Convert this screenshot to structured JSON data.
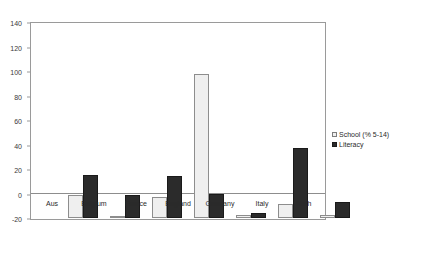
{
  "chart_data": {
    "type": "bar",
    "title": "",
    "xlabel": "",
    "ylabel": "",
    "ylim": [
      -20,
      140
    ],
    "yticks": [
      140,
      120,
      100,
      80,
      60,
      40,
      20,
      0,
      -20
    ],
    "grid": false,
    "legend_position": "right",
    "categories": [
      "Aus",
      "Belgium",
      "France",
      "England",
      "Germany",
      "Italy",
      "Neth"
    ],
    "series": [
      {
        "name": "School (% 5-14)",
        "color": "#efefef",
        "values": [
          18,
          1,
          17,
          117,
          2,
          11,
          2
        ]
      },
      {
        "name": "Literacy",
        "color": "#2b2b2b",
        "values": [
          35,
          18,
          34,
          19,
          4,
          57,
          13
        ]
      }
    ]
  },
  "legend": {
    "items": [
      {
        "label": "School (% 5-14)",
        "swatch": "school"
      },
      {
        "label": "Literacy",
        "swatch": "literacy"
      }
    ]
  }
}
